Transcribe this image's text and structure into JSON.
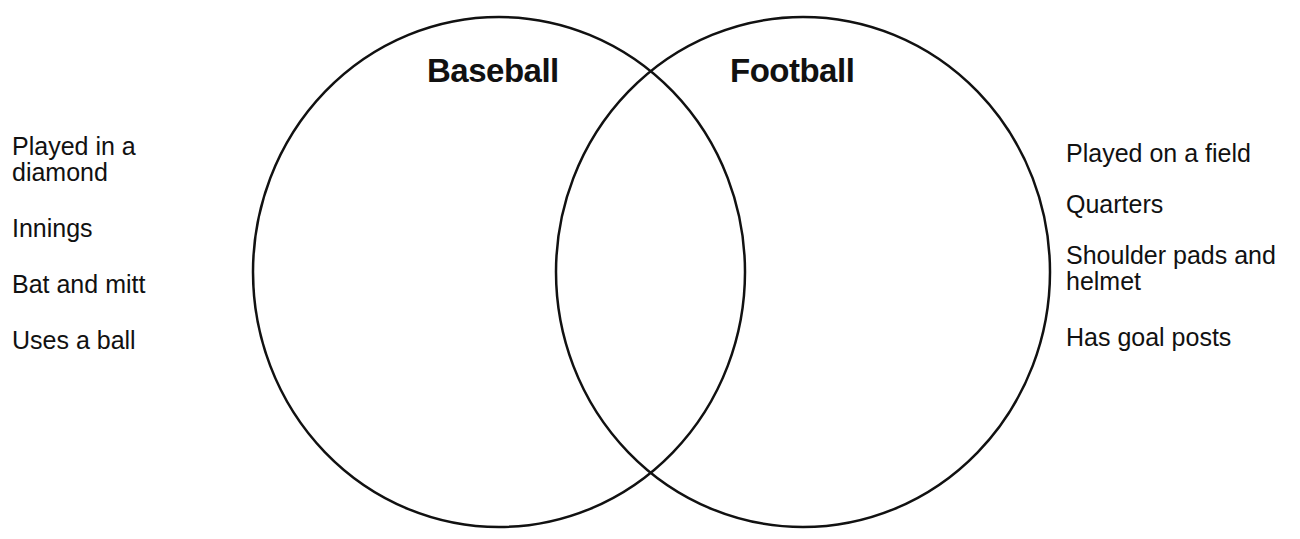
{
  "diagram": {
    "type": "venn",
    "sets": [
      {
        "name": "Baseball",
        "ellipse": {
          "cx": 499,
          "cy": 272,
          "rx": 246,
          "ry": 255
        }
      },
      {
        "name": "Football",
        "ellipse": {
          "cx": 803,
          "cy": 272,
          "rx": 247,
          "ry": 255
        }
      }
    ],
    "stroke_color": "#111111"
  },
  "baseball": {
    "title": "Baseball",
    "items": [
      "Played in a diamond",
      "Innings",
      "Bat and mitt",
      "Uses a ball"
    ]
  },
  "football": {
    "title": "Football",
    "items": [
      "Played on a field",
      "Quarters",
      "Shoulder pads and helmet",
      "Has goal posts"
    ]
  }
}
